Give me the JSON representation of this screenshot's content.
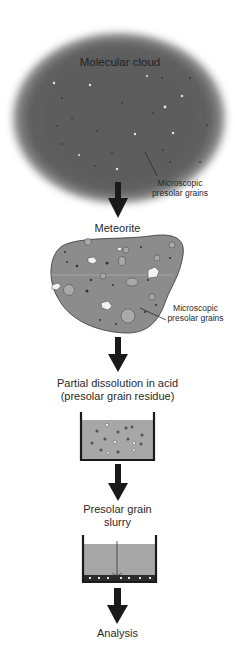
{
  "diagram": {
    "colors": {
      "cloud": "#5a5a5a",
      "meteorite": "#8a8a8a",
      "liquid": "#a8a8a8",
      "arrow": "#1a1a1a",
      "beaker": "#1a1a1a",
      "background": "#ffffff"
    },
    "stages": [
      {
        "id": "cloud",
        "label": "Molecular cloud",
        "annotation_line1": "Microscopic",
        "annotation_line2": "presolar grains"
      },
      {
        "id": "meteorite",
        "label": "Meteorite",
        "annotation_line1": "Microscopic",
        "annotation_line2": "presolar grains"
      },
      {
        "id": "dissolution",
        "label_line1": "Partial dissolution in acid",
        "label_line2": "(presolar grain residue)"
      },
      {
        "id": "slurry",
        "label_line1": "Presolar grain",
        "label_line2": "slurry"
      },
      {
        "id": "analysis",
        "label": "Analysis"
      }
    ],
    "arrows": [
      {
        "from": "cloud",
        "to": "meteorite"
      },
      {
        "from": "meteorite",
        "to": "dissolution"
      },
      {
        "from": "dissolution",
        "to": "slurry"
      },
      {
        "from": "slurry",
        "to": "analysis"
      }
    ]
  }
}
